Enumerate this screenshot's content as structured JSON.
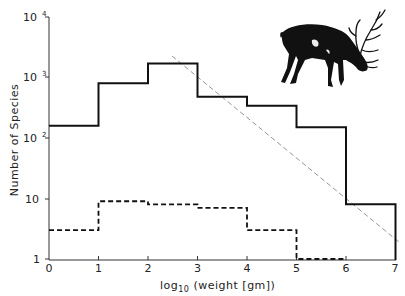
{
  "chart_data": {
    "type": "line",
    "subtype": "step-histogram",
    "title": "",
    "xlabel": "log10 (weight [gm])",
    "ylabel": "Number of Species",
    "xlim": [
      0,
      7
    ],
    "ylim": [
      1,
      10000
    ],
    "yscale": "log",
    "x_ticks": [
      0,
      1,
      2,
      3,
      4,
      5,
      6,
      7
    ],
    "x_tick_labels": [
      "0",
      "1",
      "2",
      "3",
      "4",
      "5",
      "6",
      "7"
    ],
    "y_ticks": [
      1,
      10,
      100,
      1000,
      10000
    ],
    "y_tick_labels": [
      "1",
      "10",
      "10²",
      "10³",
      "10⁴"
    ],
    "grid": false,
    "legend": null,
    "bins": [
      [
        0,
        1
      ],
      [
        1,
        2
      ],
      [
        2,
        3
      ],
      [
        3,
        4
      ],
      [
        4,
        5
      ],
      [
        5,
        6
      ],
      [
        6,
        7
      ]
    ],
    "series": [
      {
        "name": "solid",
        "style": "solid",
        "values": [
          160,
          800,
          1700,
          480,
          340,
          150,
          8
        ]
      },
      {
        "name": "dashed",
        "style": "dashed",
        "values": [
          3,
          9,
          8,
          7,
          3,
          1,
          null
        ]
      }
    ],
    "annotations": [
      {
        "type": "reference-line",
        "style": "thin dashed gray",
        "from": [
          2.5,
          3000
        ],
        "to": [
          7,
          2.5
        ]
      },
      {
        "type": "illustration",
        "description": "silhouette of a grazing elk/deer with antlers",
        "position": "upper right"
      }
    ]
  },
  "labels": {
    "xlabel_prefix": "log",
    "xlabel_sub": "10",
    "xlabel_rest": " (weight [gm])",
    "ylabel": "Number of Species",
    "x_ticks": [
      "0",
      "1",
      "2",
      "3",
      "4",
      "5",
      "6",
      "7"
    ],
    "y_ticks": [
      "1",
      "10",
      "10",
      "10",
      "10"
    ],
    "y_exps": [
      "",
      "",
      "2",
      "3",
      "4"
    ]
  }
}
